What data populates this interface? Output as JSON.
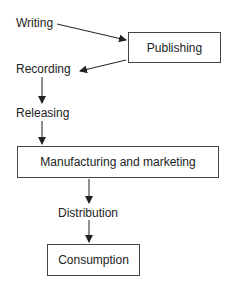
{
  "diagram": {
    "nodes": {
      "writing": "Writing",
      "publishing": "Publishing",
      "recording": "Recording",
      "releasing": "Releasing",
      "manufacturing": "Manufacturing and marketing",
      "distribution": "Distribution",
      "consumption": "Consumption"
    },
    "edges": [
      [
        "Writing",
        "Publishing"
      ],
      [
        "Publishing",
        "Recording"
      ],
      [
        "Recording",
        "Releasing"
      ],
      [
        "Releasing",
        "Manufacturing and marketing"
      ],
      [
        "Manufacturing and marketing",
        "Distribution"
      ],
      [
        "Distribution",
        "Consumption"
      ]
    ]
  }
}
